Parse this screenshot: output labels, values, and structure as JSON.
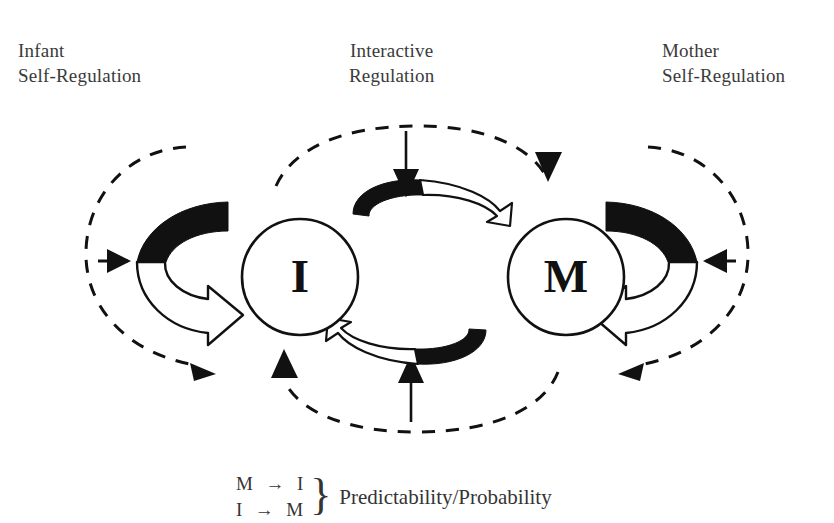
{
  "figure": {
    "background_color": "#ffffff",
    "ink_color": "#111111",
    "text_color": "#3a3a3a"
  },
  "labels": {
    "infant": {
      "line1": "Infant",
      "line2": "Self-Regulation"
    },
    "interactive": {
      "line1": "Interactive",
      "line2": "Regulation"
    },
    "mother": {
      "line1": "Mother",
      "line2": "Self-Regulation"
    }
  },
  "nodes": {
    "infant_node": {
      "letter": "I"
    },
    "mother_node": {
      "letter": "M"
    }
  },
  "caption": {
    "pair1": "M  →  I",
    "pair2": "I  →  M",
    "brace": "}",
    "term": "Predictability/Probability"
  },
  "icons": {
    "infant_self_loop": "circular-self-regulation-arrow-icon",
    "mother_self_loop": "circular-self-regulation-arrow-icon",
    "top_interactive_arrow": "curved-arrow-right-icon",
    "bottom_interactive_arrow": "curved-arrow-left-icon",
    "dashed_loop_left": "dashed-loop-icon",
    "dashed_loop_center": "dashed-loop-icon",
    "dashed_loop_right": "dashed-loop-icon",
    "pointer_top_center": "arrow-down-icon",
    "pointer_bottom_center": "arrow-up-icon",
    "pointer_left": "arrow-right-icon",
    "pointer_right": "arrow-left-icon"
  }
}
